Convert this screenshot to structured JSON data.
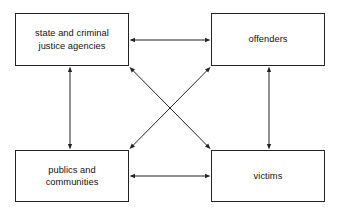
{
  "diagram": {
    "type": "relationship-diagram",
    "background_color": "#ffffff",
    "line_color": "#222222",
    "text_color": "#111111",
    "nodes": [
      {
        "id": "state-agencies",
        "label": "state and criminal\njustice agencies",
        "x": 15,
        "y": 13,
        "width": 114,
        "height": 53
      },
      {
        "id": "offenders",
        "label": "offenders",
        "x": 211,
        "y": 13,
        "width": 114,
        "height": 53
      },
      {
        "id": "publics-communities",
        "label": "publics and\ncommunities",
        "x": 15,
        "y": 150,
        "width": 114,
        "height": 52
      },
      {
        "id": "victims",
        "label": "victims",
        "x": 211,
        "y": 150,
        "width": 114,
        "height": 52
      }
    ],
    "connectors": [
      {
        "id": "state-agencies--offenders",
        "from": "state-agencies",
        "to": "offenders",
        "style": "double-arrow",
        "orientation": "horizontal"
      },
      {
        "id": "publics-communities--victims",
        "from": "publics-communities",
        "to": "victims",
        "style": "double-arrow",
        "orientation": "horizontal"
      },
      {
        "id": "state-agencies--publics-communities",
        "from": "state-agencies",
        "to": "publics-communities",
        "style": "double-arrow",
        "orientation": "vertical"
      },
      {
        "id": "offenders--victims",
        "from": "offenders",
        "to": "victims",
        "style": "double-arrow",
        "orientation": "vertical"
      },
      {
        "id": "state-agencies--victims",
        "from": "state-agencies",
        "to": "victims",
        "style": "double-arrow",
        "orientation": "diagonal"
      },
      {
        "id": "offenders--publics-communities",
        "from": "offenders",
        "to": "publics-communities",
        "style": "double-arrow",
        "orientation": "diagonal"
      }
    ]
  }
}
